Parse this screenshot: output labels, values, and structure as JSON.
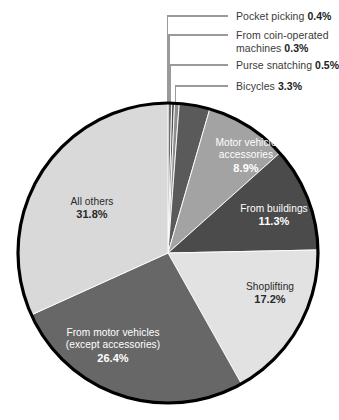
{
  "chart_data": {
    "type": "pie",
    "title": "",
    "subtitle": "",
    "xlabel": "",
    "ylabel": "",
    "legend_position": "none",
    "grid": false,
    "units": "percent",
    "start_angle_deg": 0,
    "direction": "clockwise",
    "categories": [
      "Pocket picking",
      "From coin-operated machines",
      "Purse snatching",
      "Bicycles",
      "Motor vehicle accessories",
      "From buildings",
      "Shoplifting",
      "From motor vehicles (except accessories)",
      "All others"
    ],
    "values": [
      0.4,
      0.3,
      0.5,
      3.3,
      8.9,
      11.3,
      17.2,
      26.4,
      31.8
    ],
    "slices": [
      {
        "name": "Pocket picking",
        "label": "Pocket picking",
        "percent": 0.4,
        "percent_text": "0.4%",
        "color": "#6e6e6e",
        "label_style": "callout"
      },
      {
        "name": "From coin-operated machines",
        "label_line1": "From coin-operated",
        "label_line2": "machines",
        "percent": 0.3,
        "percent_text": "0.3%",
        "color": "#4f4f4f",
        "label_style": "callout"
      },
      {
        "name": "Purse snatching",
        "label": "Purse snatching",
        "percent": 0.5,
        "percent_text": "0.5%",
        "color": "#8d8d8d",
        "label_style": "callout"
      },
      {
        "name": "Bicycles",
        "label": "Bicycles",
        "percent": 3.3,
        "percent_text": "3.3%",
        "color": "#5a5a5a",
        "label_style": "callout"
      },
      {
        "name": "Motor vehicle accessories",
        "label_line1": "Motor vehicle",
        "label_line2": "accessories",
        "percent": 8.9,
        "percent_text": "8.9%",
        "color": "#a3a3a3",
        "label_style": "inside-light"
      },
      {
        "name": "From buildings",
        "label": "From buildings",
        "percent": 11.3,
        "percent_text": "11.3%",
        "color": "#4b4b4b",
        "label_style": "inside-light"
      },
      {
        "name": "Shoplifting",
        "label": "Shoplifting",
        "percent": 17.2,
        "percent_text": "17.2%",
        "color": "#e2e2e2",
        "label_style": "inside-dark"
      },
      {
        "name": "From motor vehicles (except accessories)",
        "label_line1": "From motor vehicles",
        "label_line2": "(except accessories)",
        "percent": 26.4,
        "percent_text": "26.4%",
        "color": "#676767",
        "label_style": "inside-light"
      },
      {
        "name": "All others",
        "label": "All others",
        "percent": 31.8,
        "percent_text": "31.8%",
        "color": "#d9d9d9",
        "label_style": "inside-dark"
      }
    ]
  },
  "callouts": [
    {
      "name": "pocket-picking",
      "line1": "Pocket picking ",
      "pct": "0.4%",
      "line2": ""
    },
    {
      "name": "coin-operated-machines",
      "line1": "From coin-operated",
      "line2": "machines ",
      "pct": "0.3%"
    },
    {
      "name": "purse-snatching",
      "line1": "Purse snatching ",
      "pct": "0.5%",
      "line2": ""
    },
    {
      "name": "bicycles",
      "line1": "Bicycles ",
      "pct": "3.3%",
      "line2": ""
    }
  ],
  "inside_labels": {
    "motor_vehicle_accessories": {
      "line1": "Motor vehicle",
      "line2": "accessories",
      "pct": "8.9%"
    },
    "from_buildings": {
      "line1": "From buildings",
      "pct": "11.3%"
    },
    "shoplifting": {
      "line1": "Shoplifting",
      "pct": "17.2%"
    },
    "from_motor_vehicles": {
      "line1": "From motor vehicles",
      "line2": "(except accessories)",
      "pct": "26.4%"
    },
    "all_others": {
      "line1": "All others",
      "pct": "31.8%"
    }
  },
  "style": {
    "background": "#ffffff",
    "outline": "#000000",
    "leader_line": "#9a9a9a"
  }
}
